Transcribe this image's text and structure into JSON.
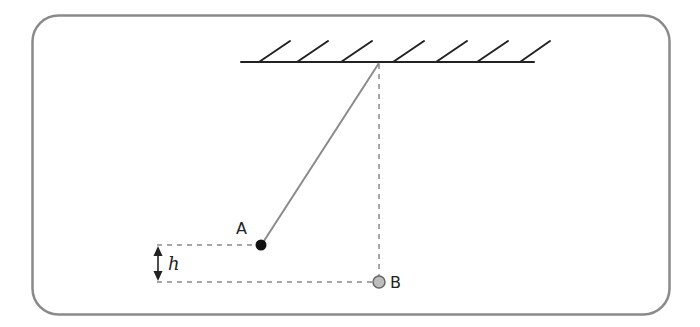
{
  "diagram": {
    "labels": {
      "point_a": "A",
      "point_b": "B",
      "height": "h"
    },
    "colors": {
      "frame": "#8a8a8a",
      "ceiling": "#222222",
      "string": "#8a8a8a",
      "dashed": "#8a8a8a",
      "ball_a": "#111111",
      "ball_b_fill": "#bdbdbd",
      "ball_b_stroke": "#666666",
      "arrow": "#222222"
    }
  }
}
